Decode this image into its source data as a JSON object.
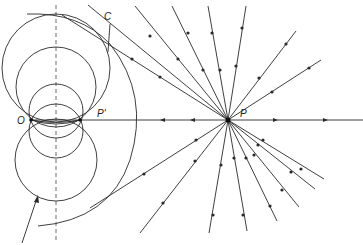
{
  "diagram": {
    "labels": {
      "C": "C",
      "O": "O",
      "P_prime": "P'",
      "P": "P"
    },
    "points": {
      "O": [
        31,
        120
      ],
      "P_prime": [
        80,
        120
      ],
      "P": [
        228,
        120
      ],
      "C": [
        107,
        22
      ]
    },
    "colors": {
      "stroke": "#2a2a2a",
      "background": "#ffffff"
    }
  }
}
